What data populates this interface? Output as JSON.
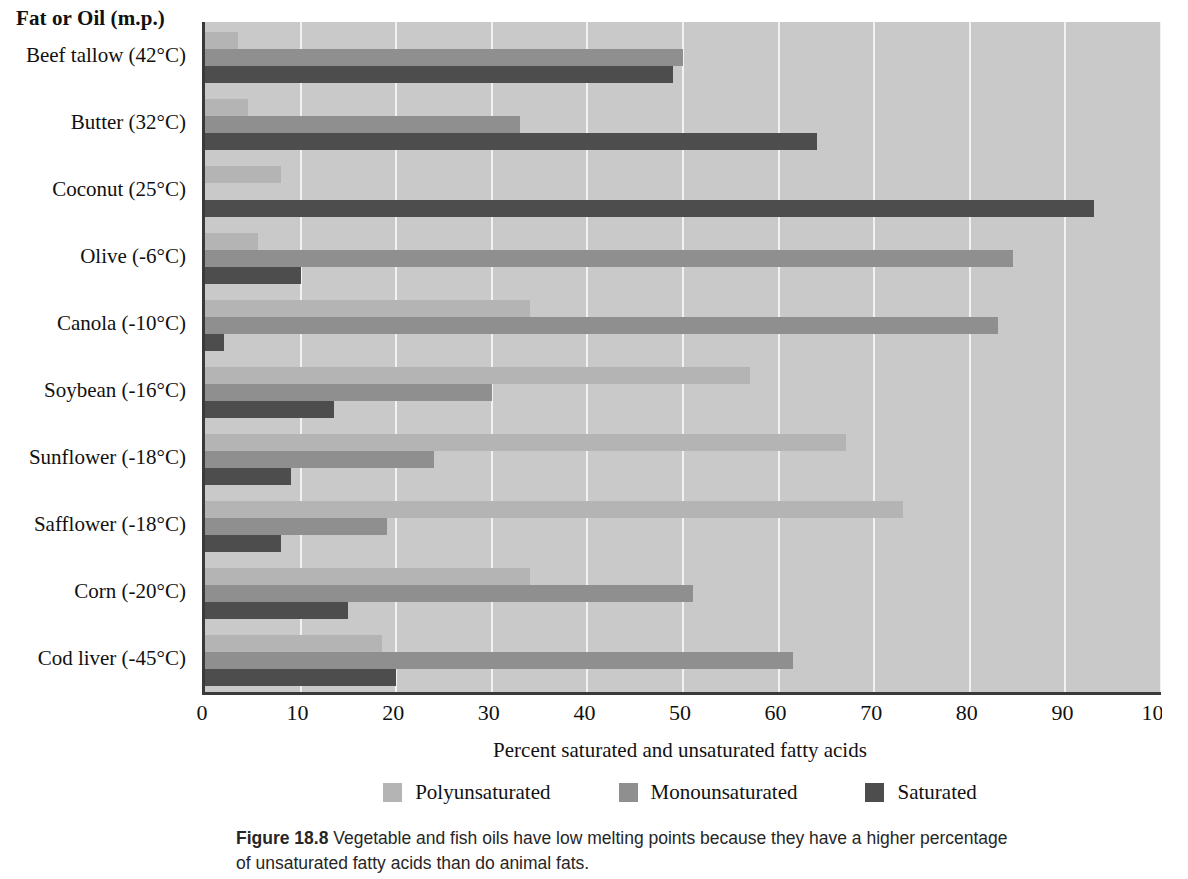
{
  "chart_data": {
    "type": "bar",
    "orientation": "horizontal",
    "title": "",
    "column_header": "Fat or Oil (m.p.)",
    "xlabel": "Percent saturated and unsaturated fatty acids",
    "ylabel": "",
    "xlim": [
      0,
      100
    ],
    "xticks": [
      0,
      10,
      20,
      30,
      40,
      50,
      60,
      70,
      80,
      90,
      100
    ],
    "grid": true,
    "grid_axis": "x",
    "legend_position": "bottom",
    "categories": [
      "Beef tallow (42°C)",
      "Butter (32°C)",
      "Coconut (25°C)",
      "Olive (-6°C)",
      "Canola (-10°C)",
      "Soybean (-16°C)",
      "Sunflower (-18°C)",
      "Safflower (-18°C)",
      "Corn (-20°C)",
      "Cod liver (-45°C)"
    ],
    "series": [
      {
        "name": "Polyunsaturated",
        "color": "#b4b4b4",
        "values": [
          3.5,
          4.5,
          8,
          5.5,
          34,
          57,
          67,
          73,
          34,
          18.5
        ]
      },
      {
        "name": "Monounsaturated",
        "color": "#8f8f8f",
        "values": [
          50,
          33,
          0,
          84.5,
          83,
          30,
          24,
          19,
          51,
          61.5
        ]
      },
      {
        "name": "Saturated",
        "color": "#4d4d4d",
        "values": [
          49,
          64,
          93,
          10,
          2,
          13.5,
          9,
          8,
          15,
          20
        ]
      }
    ]
  },
  "caption": {
    "figure_number": "Figure 18.8",
    "text": "Vegetable and fish oils have low melting points because they have a higher percentage of unsaturated fatty acids than do animal fats."
  },
  "colors": {
    "plot_background": "#c9c9c9",
    "gridline": "#f2f2f2",
    "axis": "#3a3a3a",
    "polyunsaturated": "#b4b4b4",
    "monounsaturated": "#8f8f8f",
    "saturated": "#4d4d4d"
  }
}
